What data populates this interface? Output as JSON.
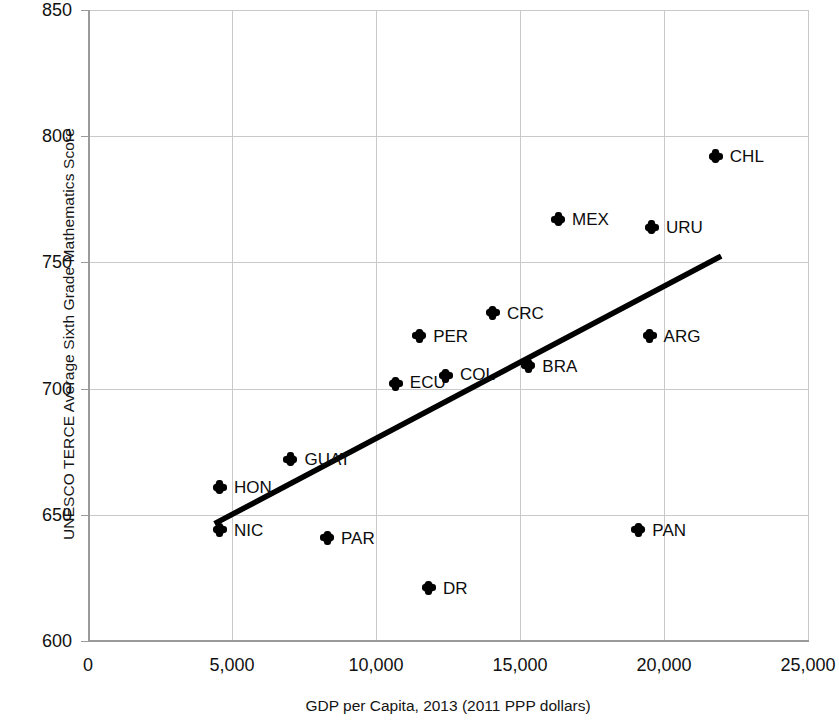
{
  "chart_data": {
    "type": "scatter",
    "title": "",
    "xlabel": "GDP per Capita, 2013 (2011 PPP dollars)",
    "ylabel": "UNESCO TERCE Average Sixth Grade Mathematics Score",
    "xlim": [
      0,
      25000
    ],
    "ylim": [
      600,
      850
    ],
    "xticks": [
      0,
      5000,
      10000,
      15000,
      20000,
      25000
    ],
    "xtick_labels": [
      "0",
      "5,000",
      "10,000",
      "15,000",
      "20,000",
      "25,000"
    ],
    "yticks": [
      600,
      650,
      700,
      750,
      800,
      850
    ],
    "ytick_labels": [
      "600",
      "650",
      "700",
      "750",
      "800",
      "850"
    ],
    "grid": true,
    "legend": "none",
    "marker_color": "#000000",
    "trendline_color": "#000000",
    "points": [
      {
        "label": "NIC",
        "x": 4580,
        "y": 644,
        "label_dx": 14,
        "label_dy": 5
      },
      {
        "label": "HON",
        "x": 4580,
        "y": 661,
        "label_dx": 14,
        "label_dy": 5
      },
      {
        "label": "GUAT",
        "x": 7030,
        "y": 672,
        "label_dx": 14,
        "label_dy": 5
      },
      {
        "label": "PAR",
        "x": 8300,
        "y": 641,
        "label_dx": 14,
        "label_dy": 5
      },
      {
        "label": "ECU",
        "x": 10690,
        "y": 702,
        "label_dx": 14,
        "label_dy": 7
      },
      {
        "label": "PER",
        "x": 11500,
        "y": 721,
        "label_dx": 14,
        "label_dy": 5
      },
      {
        "label": "DR",
        "x": 11840,
        "y": 621,
        "label_dx": 14,
        "label_dy": 5
      },
      {
        "label": "COL",
        "x": 12430,
        "y": 705,
        "label_dx": 14,
        "label_dy": 7
      },
      {
        "label": "CRC",
        "x": 14060,
        "y": 730,
        "label_dx": 14,
        "label_dy": 5
      },
      {
        "label": "BRA",
        "x": 15290,
        "y": 709,
        "label_dx": 14,
        "label_dy": 5
      },
      {
        "label": "MEX",
        "x": 16320,
        "y": 767,
        "label_dx": 14,
        "label_dy": 5
      },
      {
        "label": "PAN",
        "x": 19110,
        "y": 644,
        "label_dx": 14,
        "label_dy": 5
      },
      {
        "label": "ARG",
        "x": 19500,
        "y": 721,
        "label_dx": 14,
        "label_dy": 5
      },
      {
        "label": "URU",
        "x": 19580,
        "y": 764,
        "label_dx": 14,
        "label_dy": 5
      },
      {
        "label": "CHL",
        "x": 21800,
        "y": 792,
        "label_dx": 14,
        "label_dy": 5
      }
    ],
    "trendline": {
      "x0": 4480,
      "y0": 647,
      "x1": 21900,
      "y1": 752
    }
  }
}
